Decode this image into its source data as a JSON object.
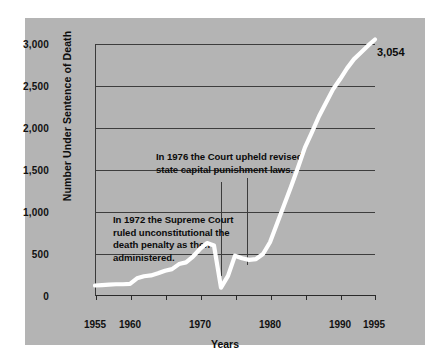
{
  "chart_data": {
    "type": "line",
    "title": "",
    "xlabel": "Years",
    "ylabel": "Number Under Sentence of Death",
    "xlim": [
      1955,
      1995
    ],
    "ylim": [
      0,
      3000
    ],
    "grid": true,
    "legend": "none",
    "line_color": "#ffffff",
    "background_color": "#b4b4b4",
    "axis_color": "#2a2a2a",
    "text_color": "#0b0b0b",
    "xticks": [
      1955,
      1960,
      1965,
      1970,
      1975,
      1980,
      1985,
      1990,
      1995
    ],
    "xtick_labels": [
      "1955",
      "1960",
      "",
      "1970",
      "",
      "1980",
      "",
      "1990",
      "1995"
    ],
    "yticks": [
      0,
      500,
      1000,
      1500,
      2000,
      2500,
      3000
    ],
    "ytick_labels": [
      "0",
      "500",
      "1,000",
      "1,500",
      "2,000",
      "2,500",
      "3,000"
    ],
    "end_value_label": "3,054",
    "x": [
      1955,
      1956,
      1957,
      1958,
      1959,
      1960,
      1961,
      1962,
      1963,
      1964,
      1965,
      1966,
      1967,
      1968,
      1969,
      1970,
      1971,
      1972,
      1973,
      1974,
      1975,
      1976,
      1977,
      1978,
      1979,
      1980,
      1981,
      1982,
      1983,
      1984,
      1985,
      1986,
      1987,
      1988,
      1989,
      1990,
      1991,
      1992,
      1993,
      1994,
      1995
    ],
    "values": [
      125,
      130,
      135,
      140,
      140,
      145,
      210,
      235,
      245,
      270,
      300,
      320,
      380,
      400,
      470,
      560,
      630,
      600,
      100,
      240,
      480,
      450,
      430,
      440,
      500,
      640,
      860,
      1080,
      1300,
      1530,
      1770,
      1950,
      2140,
      2300,
      2460,
      2580,
      2710,
      2820,
      2900,
      2980,
      3054
    ]
  },
  "annotations": {
    "note_1976": {
      "line1": "In 1976 the Court upheld revised",
      "line2": "state capital punishment laws.",
      "anchor_year": 1976
    },
    "note_1972": {
      "line1": "In 1972 the Supreme Court",
      "line2": "ruled unconstitutional the",
      "line3": "death penalty as then",
      "line4": "administered.",
      "anchor_year": 1972
    }
  }
}
